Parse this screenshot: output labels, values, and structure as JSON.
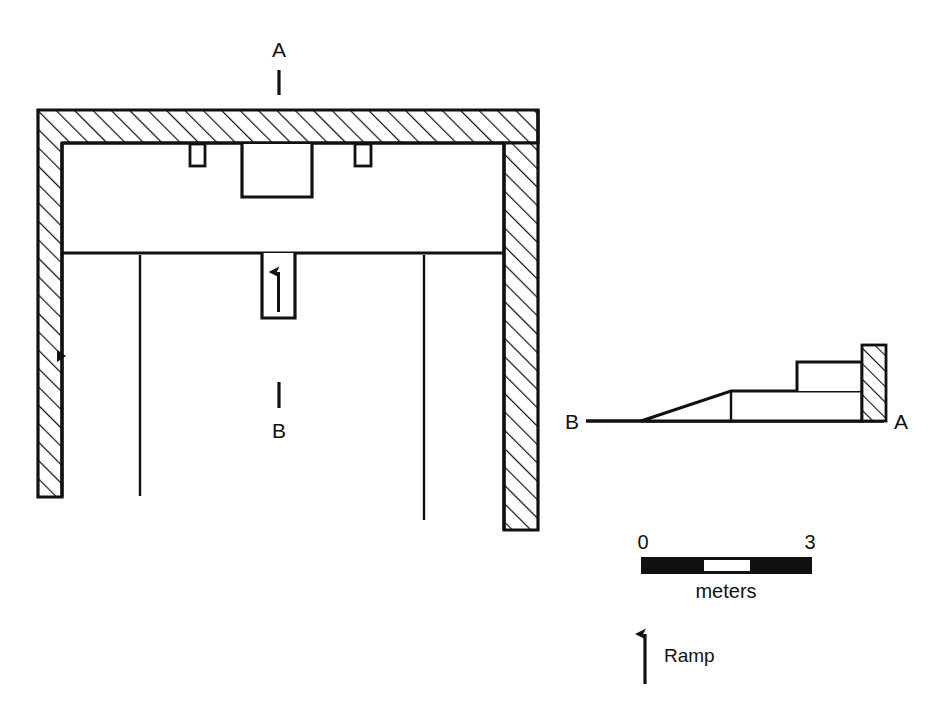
{
  "figure": {
    "background_color": "#ffffff",
    "ink_color": "#111111",
    "width": 943,
    "height": 716
  },
  "plan": {
    "name": "plan-view",
    "section_line_top": {
      "label": "A",
      "tick_label_x": 279,
      "tick_label_y": 56
    },
    "section_line_bottom": {
      "label": "B",
      "tick_label_x": 279,
      "tick_label_y": 437
    },
    "ramp_arrow": {
      "name": "ramp-direction-arrow",
      "direction": "up"
    },
    "wall_hatch_pattern": "diagonal-hatch",
    "outer_wall": {
      "left": 38,
      "top": 110,
      "right": 538,
      "inner_left": 62,
      "inner_top": 143,
      "inner_right": 504,
      "left_wall_bottom": 497,
      "right_wall_bottom": 530
    },
    "features": {
      "notch_left": {
        "x": 190,
        "y": 145,
        "w": 15,
        "h": 21
      },
      "notch_right": {
        "x": 355,
        "y": 145,
        "w": 16,
        "h": 21
      },
      "central_block": {
        "x": 242,
        "y": 145,
        "w": 70,
        "h": 52
      },
      "ramp_box": {
        "x": 262,
        "y": 253,
        "w": 33,
        "h": 65
      },
      "cross_wall_y": 253,
      "partitions_x": [
        140,
        263,
        293,
        424
      ],
      "partition_bottom_left": 496,
      "partition_bottom_right": 520,
      "doorway_mark_y": 355
    }
  },
  "section": {
    "name": "section-view",
    "label_left": "B",
    "label_right": "A",
    "baseline_y": 421,
    "baseline_x_start": 586,
    "baseline_x_end": 880,
    "ramp_start_x": 641,
    "platform_top_y": 391,
    "platform_start_x": 731,
    "step_top_y": 362,
    "step_start_x": 797,
    "wall_hatched_x": 862,
    "wall_hatched_w": 24,
    "wall_top_y": 345
  },
  "scale_bar": {
    "name": "scale-bar",
    "start_label": "0",
    "end_label": "3",
    "unit_label": "meters",
    "x": 641,
    "y": 557,
    "width": 171,
    "height": 16,
    "segments": [
      {
        "fill": "#111111",
        "fraction": 0.37
      },
      {
        "fill": "#ffffff",
        "fraction": 0.27
      },
      {
        "fill": "#111111",
        "fraction": 0.36
      }
    ]
  },
  "legend": {
    "name": "legend-ramp",
    "arrow_label": "Ramp",
    "arrow_x": 645,
    "arrow_top_y": 624,
    "arrow_bottom_y": 684,
    "text_x": 662,
    "text_y": 660
  }
}
